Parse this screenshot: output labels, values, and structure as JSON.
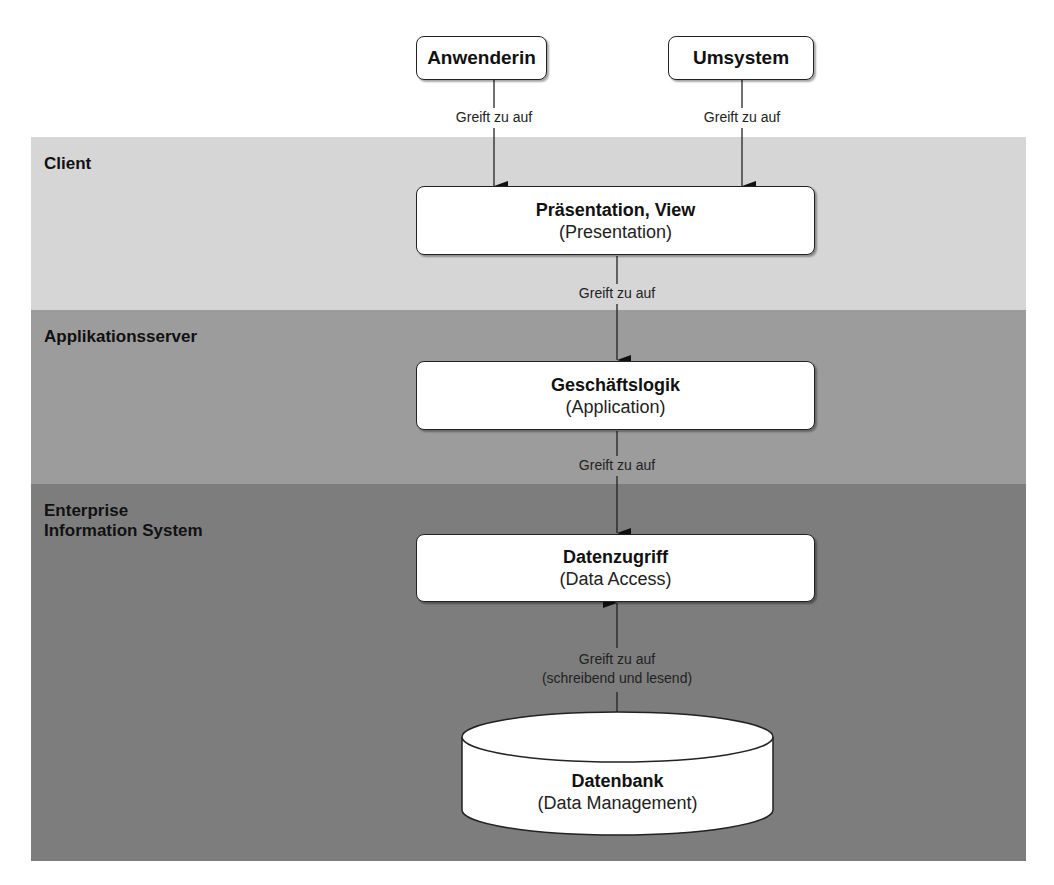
{
  "colors": {
    "band_client": "#d6d6d6",
    "band_appserver": "#9c9c9c",
    "band_eis": "#7d7d7d",
    "node_fill": "#ffffff",
    "stroke": "#222222"
  },
  "actors": [
    {
      "label": "Anwenderin"
    },
    {
      "label": "Umsystem"
    }
  ],
  "bands": [
    {
      "label": "Client"
    },
    {
      "label": "Applikationsserver"
    },
    {
      "label_line1": "Enterprise",
      "label_line2": "Information System"
    }
  ],
  "layers": [
    {
      "title": "Präsentation, View",
      "subtitle": "(Presentation)"
    },
    {
      "title": "Geschäftslogik",
      "subtitle": "(Application)"
    },
    {
      "title": "Datenzugriff",
      "subtitle": "(Data Access)"
    }
  ],
  "database": {
    "title": "Datenbank",
    "subtitle": "(Data Management)"
  },
  "edges": [
    {
      "from": "Anwenderin",
      "to": "Präsentation, View",
      "label": "Greift zu auf"
    },
    {
      "from": "Umsystem",
      "to": "Präsentation, View",
      "label": "Greift zu auf"
    },
    {
      "from": "Präsentation, View",
      "to": "Geschäftslogik",
      "label": "Greift zu auf"
    },
    {
      "from": "Geschäftslogik",
      "to": "Datenzugriff",
      "label": "Greift zu auf"
    },
    {
      "from": "Datenzugriff",
      "to": "Datenbank",
      "label_line1": "Greift zu auf",
      "label_line2": "(schreibend und lesend)",
      "bidirectional": true
    }
  ]
}
